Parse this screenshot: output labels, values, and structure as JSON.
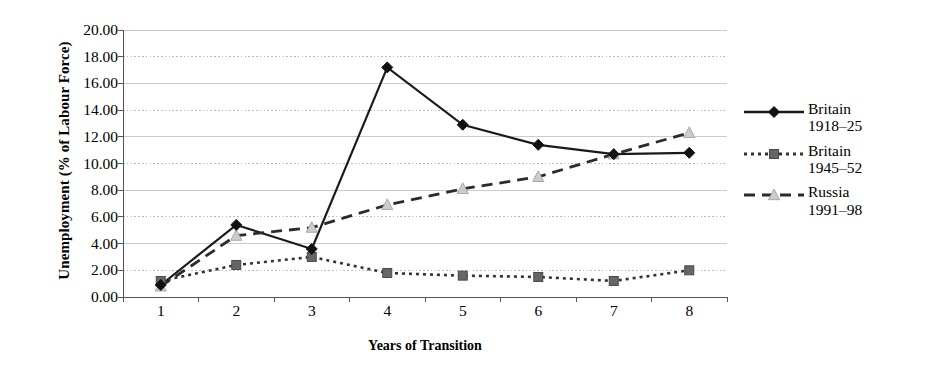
{
  "chart_data": {
    "type": "line",
    "title": "",
    "xlabel": "Years of Transition",
    "ylabel": "Unemployment (% of Labour Force)",
    "x": [
      1,
      2,
      3,
      4,
      5,
      6,
      7,
      8
    ],
    "categories": [
      "1",
      "2",
      "3",
      "4",
      "5",
      "6",
      "7",
      "8"
    ],
    "xlim": [
      0.5,
      8.5
    ],
    "ylim": [
      0.0,
      20.0
    ],
    "ytick_labels": [
      "0.00",
      "2.00",
      "4.00",
      "6.00",
      "8.00",
      "10.00",
      "12.00",
      "14.00",
      "16.00",
      "18.00",
      "20.00"
    ],
    "ytick_values": [
      0,
      2,
      4,
      6,
      8,
      10,
      12,
      14,
      16,
      18,
      20
    ],
    "grid": true,
    "grid_axis": "y",
    "legend_position": "right",
    "series": [
      {
        "name": "Britain\n1918–25",
        "label_line1": "Britain",
        "label_line2": "1918–25",
        "marker": "diamond",
        "linestyle": "solid",
        "color": "#1a1a1a",
        "marker_color": "#111111",
        "values": [
          0.9,
          5.4,
          3.6,
          17.2,
          12.9,
          11.4,
          10.7,
          10.8
        ]
      },
      {
        "name": "Britain\n1945–52",
        "label_line1": "Britain",
        "label_line2": "1945–52",
        "marker": "square",
        "linestyle": "dotted",
        "color": "#333333",
        "marker_color": "#666666",
        "values": [
          1.2,
          2.4,
          3.0,
          1.8,
          1.6,
          1.5,
          1.2,
          2.0
        ]
      },
      {
        "name": "Russia\n1991–98",
        "label_line1": "Russia",
        "label_line2": "1991–98",
        "marker": "triangle",
        "linestyle": "dashed",
        "color": "#2b2b2b",
        "marker_color": "#cccccc",
        "values": [
          0.8,
          4.6,
          5.2,
          6.9,
          8.1,
          9.0,
          10.7,
          12.3
        ]
      }
    ]
  },
  "legend": {
    "items": [
      {
        "text": "Britain\n1918–25",
        "marker": "diamond",
        "linestyle": "solid"
      },
      {
        "text": "Britain\n1945–52",
        "marker": "square",
        "linestyle": "dotted"
      },
      {
        "text": "Russia\n1991–98",
        "marker": "triangle",
        "linestyle": "dashed"
      }
    ]
  }
}
